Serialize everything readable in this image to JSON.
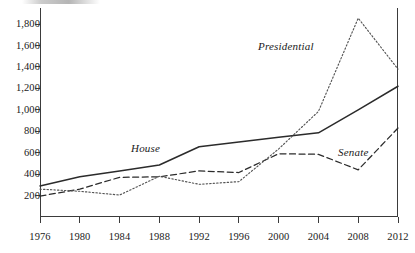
{
  "chart_data": {
    "type": "line",
    "title": "",
    "subtitle": "",
    "xlabel": "",
    "ylabel": "",
    "x": [
      1976,
      1980,
      1984,
      1988,
      1992,
      1996,
      2000,
      2004,
      2008,
      2012
    ],
    "categories": [
      "1976",
      "1980",
      "1984",
      "1988",
      "1992",
      "1996",
      "2000",
      "2004",
      "2008",
      "2012"
    ],
    "xlim": [
      1976,
      2012
    ],
    "ylim": [
      0,
      1950
    ],
    "yticks": [
      200,
      400,
      600,
      800,
      1000,
      1200,
      1400,
      1600,
      1800
    ],
    "ytick_labels": [
      "200",
      "400",
      "600",
      "800",
      "1,000",
      "1,200",
      "1,400",
      "1,600",
      "1,800"
    ],
    "grid": false,
    "legend_position": "inline-annotations",
    "series": [
      {
        "name": "House",
        "style": "solid",
        "color": "#2b2b2b",
        "values": [
          290,
          375,
          430,
          485,
          655,
          700,
          745,
          785,
          1000,
          1220
        ]
      },
      {
        "name": "Senate",
        "style": "dashed",
        "color": "#2b2b2b",
        "values": [
          195,
          260,
          370,
          375,
          430,
          415,
          590,
          585,
          440,
          830
        ]
      },
      {
        "name": "Presidential",
        "style": "dotted",
        "color": "#555555",
        "values": [
          260,
          240,
          205,
          380,
          305,
          330,
          635,
          985,
          1855,
          1380
        ]
      }
    ],
    "annotations": [
      {
        "text": "House",
        "series": "House"
      },
      {
        "text": "Senate",
        "series": "Senate"
      },
      {
        "text": "Presidential",
        "series": "Presidential"
      }
    ]
  }
}
